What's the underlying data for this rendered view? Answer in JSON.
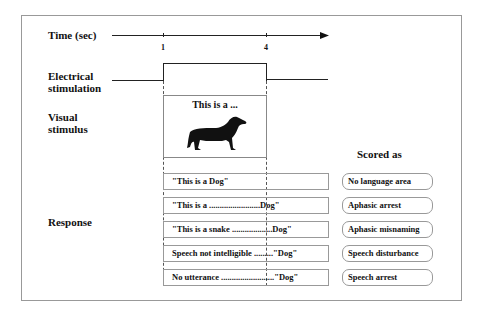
{
  "labels": {
    "time": "Time (sec)",
    "electrical_1": "Electrical",
    "electrical_2": "stimulation",
    "visual_1": "Visual",
    "visual_2": "stimulus",
    "response": "Response",
    "scored_as": "Scored as"
  },
  "time_ticks": [
    "1",
    "4"
  ],
  "stimulus": {
    "caption": "This is a ...",
    "image": "dachshund-dog-silhouette"
  },
  "rows": [
    {
      "response": "\"This is a Dog\"",
      "score": "No language area"
    },
    {
      "response": "\"This is a ........................Dog\"",
      "score": "Aphasic arrest"
    },
    {
      "response": "\"This is a snake ...................Dog\"",
      "score": "Aphasic misnaming"
    },
    {
      "response": "Speech not intelligible .........\"Dog\"",
      "score": "Speech disturbance"
    },
    {
      "response": "No utterance .........................\"Dog\"",
      "score": "Speech arrest"
    }
  ]
}
